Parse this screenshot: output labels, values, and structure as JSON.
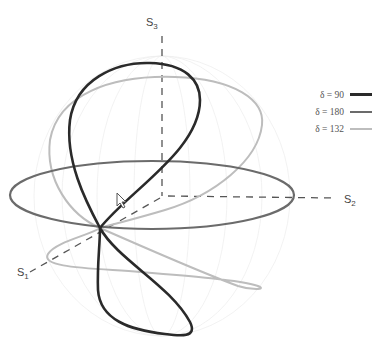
{
  "axes": {
    "s1": {
      "label": "S",
      "sub": "1"
    },
    "s2": {
      "label": "S",
      "sub": "2"
    },
    "s3": {
      "label": "S",
      "sub": "3"
    }
  },
  "legend": [
    {
      "label": "δ = 90",
      "symbol": "δ",
      "value": "90",
      "color": "#2a2a2a",
      "width": 2.6
    },
    {
      "label": "δ = 180",
      "symbol": "δ",
      "value": "180",
      "color": "#6b6b6b",
      "width": 2.2
    },
    {
      "label": "δ = 132",
      "symbol": "δ",
      "value": "132",
      "color": "#bdbdbd",
      "width": 2.0
    }
  ],
  "colors": {
    "delta90": "#2a2a2a",
    "delta180": "#6b6b6b",
    "delta132": "#bdbdbd",
    "axis": "#555555",
    "sphere_grid": "#eeeeee"
  }
}
